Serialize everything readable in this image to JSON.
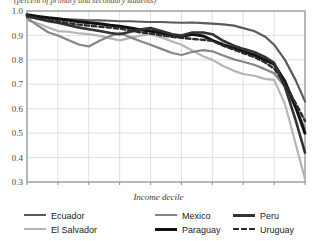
{
  "figure": {
    "title_partial": "(percent of primary and secondary students)",
    "xaxis_title": "Income decile"
  },
  "legend": {
    "columns": [
      {
        "entries": [
          {
            "label": "Ecuador",
            "color": "#5a5a5a",
            "style": "solid",
            "width": 2.2
          },
          {
            "label": "El Salvador",
            "color": "#b5b5b5",
            "style": "solid",
            "width": 2.2
          }
        ]
      },
      {
        "entries": [
          {
            "label": "Mexico",
            "color": "#868686",
            "style": "solid",
            "width": 2.2
          },
          {
            "label": "Paraguay",
            "color": "#111111",
            "style": "solid",
            "width": 3.0
          }
        ]
      },
      {
        "entries": [
          {
            "label": "Peru",
            "color": "#333333",
            "style": "solid",
            "width": 2.6
          },
          {
            "label": "Uruguay",
            "color": "#2b2b2b",
            "style": "dashed",
            "width": 2.4
          }
        ]
      }
    ]
  },
  "chart_data": {
    "type": "line",
    "title": "(percent of primary and secondary students)",
    "xlabel": "Income decile",
    "ylabel": "",
    "x": [
      1,
      2,
      3,
      4,
      5,
      6,
      7,
      8,
      9,
      10
    ],
    "xlim": [
      1,
      10
    ],
    "ylim": [
      0.3,
      1.0
    ],
    "yticks": [
      0.3,
      0.4,
      0.5,
      0.6,
      0.7,
      0.8,
      0.9,
      1.0
    ],
    "ytick_labels": [
      "0.3",
      "0.4",
      "0.5",
      "0.6",
      "0.7",
      "0.8",
      "0.9",
      "1.0"
    ],
    "xticks": [
      1,
      2,
      3,
      4,
      5,
      6,
      7,
      8,
      9,
      10
    ],
    "xtick_labels": [
      "1",
      "2",
      "3",
      "4",
      "5",
      "6",
      "7",
      "8",
      "9",
      "10"
    ],
    "grid": true,
    "legend_position": "bottom",
    "series": [
      {
        "name": "Ecuador",
        "color": "#5a5a5a",
        "style": "solid",
        "width": 2.2,
        "values": [
          0.975,
          0.968,
          0.962,
          0.958,
          0.955,
          0.952,
          0.948,
          0.93,
          0.862,
          0.63
        ],
        "dense_x": [
          1,
          1.35,
          1.7,
          2,
          2.35,
          2.7,
          3,
          3.35,
          3.7,
          4,
          4.35,
          4.7,
          5,
          5.35,
          5.7,
          6,
          6.35,
          6.7,
          7,
          7.35,
          7.7,
          8,
          8.35,
          8.7,
          9,
          9.35,
          9.7,
          10
        ],
        "dense_y": [
          0.975,
          0.972,
          0.97,
          0.968,
          0.966,
          0.964,
          0.962,
          0.962,
          0.96,
          0.958,
          0.958,
          0.956,
          0.955,
          0.955,
          0.953,
          0.952,
          0.953,
          0.95,
          0.948,
          0.945,
          0.94,
          0.93,
          0.918,
          0.896,
          0.862,
          0.8,
          0.716,
          0.63
        ]
      },
      {
        "name": "El Salvador",
        "color": "#b5b5b5",
        "style": "solid",
        "width": 2.2,
        "values": [
          0.962,
          0.918,
          0.905,
          0.88,
          0.905,
          0.862,
          0.8,
          0.742,
          0.718,
          0.312
        ],
        "dense_x": [
          1,
          1.35,
          1.7,
          2,
          2.35,
          2.7,
          3,
          3.35,
          3.7,
          4,
          4.35,
          4.7,
          5,
          5.35,
          5.7,
          6,
          6.35,
          6.7,
          7,
          7.35,
          7.7,
          8,
          8.35,
          8.7,
          9,
          9.35,
          9.7,
          10
        ],
        "dense_y": [
          0.962,
          0.95,
          0.932,
          0.918,
          0.915,
          0.908,
          0.905,
          0.898,
          0.888,
          0.88,
          0.89,
          0.9,
          0.905,
          0.892,
          0.875,
          0.862,
          0.838,
          0.815,
          0.8,
          0.775,
          0.755,
          0.742,
          0.735,
          0.722,
          0.718,
          0.62,
          0.455,
          0.312
        ]
      },
      {
        "name": "Mexico",
        "color": "#868686",
        "style": "solid",
        "width": 2.2,
        "values": [
          0.972,
          0.9,
          0.855,
          0.91,
          0.862,
          0.82,
          0.835,
          0.792,
          0.745,
          0.52
        ],
        "dense_x": [
          1,
          1.35,
          1.7,
          2,
          2.35,
          2.7,
          3,
          3.35,
          3.7,
          4,
          4.35,
          4.7,
          5,
          5.35,
          5.7,
          6,
          6.35,
          6.7,
          7,
          7.35,
          7.7,
          8,
          8.35,
          8.7,
          9,
          9.35,
          9.7,
          10
        ],
        "dense_y": [
          0.972,
          0.94,
          0.912,
          0.9,
          0.88,
          0.862,
          0.855,
          0.878,
          0.898,
          0.91,
          0.892,
          0.875,
          0.862,
          0.845,
          0.828,
          0.82,
          0.832,
          0.84,
          0.835,
          0.818,
          0.802,
          0.792,
          0.78,
          0.762,
          0.745,
          0.69,
          0.602,
          0.52
        ]
      },
      {
        "name": "Paraguay",
        "color": "#111111",
        "style": "solid",
        "width": 3.0,
        "values": [
          0.985,
          0.968,
          0.952,
          0.938,
          0.918,
          0.895,
          0.88,
          0.835,
          0.782,
          0.5
        ],
        "dense_x": [
          1,
          1.35,
          1.7,
          2,
          2.35,
          2.7,
          3,
          3.35,
          3.7,
          4,
          4.35,
          4.7,
          5,
          5.35,
          5.7,
          6,
          6.35,
          6.7,
          7,
          7.35,
          7.7,
          8,
          8.35,
          8.7,
          9,
          9.35,
          9.7,
          10
        ],
        "dense_y": [
          0.985,
          0.978,
          0.972,
          0.968,
          0.962,
          0.956,
          0.952,
          0.948,
          0.942,
          0.938,
          0.93,
          0.922,
          0.918,
          0.91,
          0.9,
          0.895,
          0.905,
          0.898,
          0.88,
          0.862,
          0.848,
          0.835,
          0.82,
          0.8,
          0.782,
          0.712,
          0.606,
          0.5
        ]
      },
      {
        "name": "Peru",
        "color": "#333333",
        "style": "solid",
        "width": 2.6,
        "values": [
          0.98,
          0.952,
          0.925,
          0.905,
          0.93,
          0.9,
          0.905,
          0.845,
          0.788,
          0.42
        ],
        "dense_x": [
          1,
          1.35,
          1.7,
          2,
          2.35,
          2.7,
          3,
          3.35,
          3.7,
          4,
          4.35,
          4.7,
          5,
          5.35,
          5.7,
          6,
          6.35,
          6.7,
          7,
          7.35,
          7.7,
          8,
          8.35,
          8.7,
          9,
          9.35,
          9.7,
          10
        ],
        "dense_y": [
          0.98,
          0.968,
          0.958,
          0.952,
          0.942,
          0.932,
          0.925,
          0.918,
          0.91,
          0.905,
          0.915,
          0.925,
          0.93,
          0.918,
          0.905,
          0.9,
          0.912,
          0.912,
          0.905,
          0.878,
          0.858,
          0.845,
          0.832,
          0.812,
          0.788,
          0.69,
          0.552,
          0.42
        ]
      },
      {
        "name": "Uruguay",
        "color": "#2b2b2b",
        "style": "dashed",
        "width": 2.4,
        "values": [
          0.978,
          0.958,
          0.94,
          0.928,
          0.908,
          0.89,
          0.878,
          0.828,
          0.765,
          0.55
        ],
        "dense_x": [
          1,
          1.35,
          1.7,
          2,
          2.35,
          2.7,
          3,
          3.35,
          3.7,
          4,
          4.35,
          4.7,
          5,
          5.35,
          5.7,
          6,
          6.35,
          6.7,
          7,
          7.35,
          7.7,
          8,
          8.35,
          8.7,
          9,
          9.35,
          9.7,
          10
        ],
        "dense_y": [
          0.978,
          0.97,
          0.962,
          0.958,
          0.95,
          0.944,
          0.94,
          0.936,
          0.932,
          0.928,
          0.92,
          0.912,
          0.908,
          0.9,
          0.894,
          0.89,
          0.886,
          0.882,
          0.878,
          0.858,
          0.842,
          0.828,
          0.812,
          0.79,
          0.765,
          0.7,
          0.622,
          0.55
        ]
      }
    ]
  }
}
